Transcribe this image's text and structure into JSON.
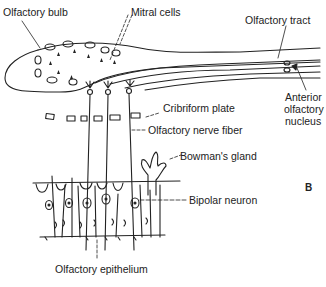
{
  "figure": {
    "panel_label": "B",
    "labels": {
      "olfactory_bulb": "Olfactory bulb",
      "mitral_cells": "Mitral cells",
      "olfactory_tract": "Olfactory tract",
      "anterior_olfactory_nucleus_1": "Anterior",
      "anterior_olfactory_nucleus_2": "olfactory",
      "anterior_olfactory_nucleus_3": "nucleus",
      "cribriform_plate": "Cribriform plate",
      "olfactory_nerve_fiber": "Olfactory nerve fiber",
      "bowmans_gland": "Bowman's gland",
      "bipolar_neuron": "Bipolar neuron",
      "olfactory_epithelium": "Olfactory epithelium"
    },
    "colors": {
      "ink": "#222222",
      "background": "#ffffff"
    }
  }
}
